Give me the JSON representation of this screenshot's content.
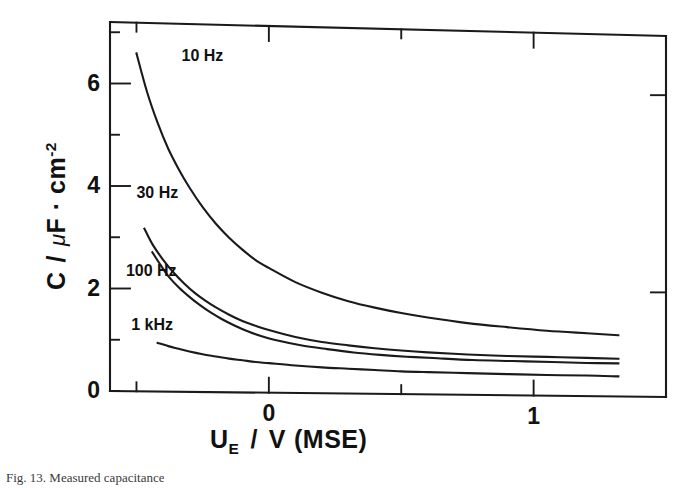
{
  "figure": {
    "caption": "Fig. 13.  Measured capacitance"
  },
  "axes": {
    "y_title_symbol": "C",
    "y_title_separator": "/",
    "y_title_unit_mu": "μ",
    "y_title_unit_main": "F · cm",
    "y_title_unit_exponent": "-2",
    "x_title_symbol": "U",
    "x_title_subscript": "E",
    "x_title_separator": "/",
    "x_title_unit": "V",
    "x_title_reference": "(MSE)"
  },
  "chart_data": {
    "type": "line",
    "title": "",
    "xlabel": "U_E / V (MSE)",
    "ylabel": "C / μF·cm^-2",
    "xlim": [
      -0.6,
      1.5
    ],
    "ylim": [
      0,
      7.2
    ],
    "grid": false,
    "legend": "inline-curve-labels",
    "xticks": [
      -0.5,
      0,
      0.5,
      1,
      1.5
    ],
    "xtick_labels": [
      "",
      "0",
      "",
      "1",
      ""
    ],
    "yticks": [
      0,
      1,
      2,
      3,
      4,
      5,
      6,
      7
    ],
    "ytick_labels": [
      "0",
      "",
      "2",
      "",
      "4",
      "",
      "6",
      ""
    ],
    "series": [
      {
        "name": "10 Hz",
        "label_x": -0.33,
        "label_y": 6.55,
        "x": [
          -0.5,
          -0.46,
          -0.42,
          -0.38,
          -0.34,
          -0.3,
          -0.25,
          -0.2,
          -0.15,
          -0.1,
          -0.05,
          0.0,
          0.1,
          0.2,
          0.3,
          0.4,
          0.5,
          0.6,
          0.75,
          0.9,
          1.05,
          1.2,
          1.32
        ],
        "y": [
          6.6,
          5.85,
          5.25,
          4.75,
          4.35,
          4.0,
          3.62,
          3.3,
          3.03,
          2.8,
          2.6,
          2.45,
          2.18,
          1.98,
          1.82,
          1.7,
          1.6,
          1.52,
          1.42,
          1.35,
          1.29,
          1.25,
          1.22
        ]
      },
      {
        "name": "30 Hz",
        "label_x": -0.5,
        "label_y": 3.85,
        "x": [
          -0.47,
          -0.44,
          -0.4,
          -0.36,
          -0.32,
          -0.28,
          -0.24,
          -0.2,
          -0.15,
          -0.1,
          -0.05,
          0.0,
          0.1,
          0.2,
          0.3,
          0.4,
          0.5,
          0.6,
          0.75,
          0.9,
          1.05,
          1.2,
          1.32
        ],
        "y": [
          3.18,
          2.88,
          2.58,
          2.33,
          2.12,
          1.94,
          1.79,
          1.66,
          1.52,
          1.4,
          1.31,
          1.23,
          1.1,
          1.01,
          0.95,
          0.9,
          0.86,
          0.83,
          0.8,
          0.78,
          0.77,
          0.76,
          0.75
        ]
      },
      {
        "name": "100 Hz",
        "label_x": -0.54,
        "label_y": 2.32,
        "x": [
          -0.44,
          -0.41,
          -0.38,
          -0.34,
          -0.3,
          -0.26,
          -0.22,
          -0.18,
          -0.13,
          -0.08,
          -0.03,
          0.02,
          0.12,
          0.22,
          0.32,
          0.42,
          0.52,
          0.62,
          0.77,
          0.92,
          1.07,
          1.2,
          1.32
        ],
        "y": [
          2.72,
          2.48,
          2.26,
          2.04,
          1.86,
          1.7,
          1.56,
          1.44,
          1.31,
          1.2,
          1.11,
          1.04,
          0.94,
          0.87,
          0.81,
          0.77,
          0.74,
          0.72,
          0.69,
          0.68,
          0.67,
          0.66,
          0.66
        ]
      },
      {
        "name": "1 kHz",
        "label_x": -0.52,
        "label_y": 1.28,
        "x": [
          -0.42,
          -0.38,
          -0.34,
          -0.3,
          -0.25,
          -0.2,
          -0.15,
          -0.1,
          -0.05,
          0.0,
          0.1,
          0.2,
          0.3,
          0.4,
          0.5,
          0.6,
          0.75,
          0.9,
          1.05,
          1.2,
          1.32
        ],
        "y": [
          0.95,
          0.89,
          0.84,
          0.79,
          0.74,
          0.7,
          0.66,
          0.63,
          0.6,
          0.58,
          0.54,
          0.51,
          0.49,
          0.47,
          0.45,
          0.44,
          0.43,
          0.42,
          0.41,
          0.41,
          0.4
        ]
      }
    ]
  }
}
